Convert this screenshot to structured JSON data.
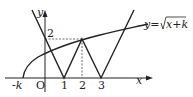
{
  "diagram": {
    "axes": {
      "x_label": "x",
      "y_label": "y",
      "origin_label": "O"
    },
    "x_ticks": [
      "-k",
      "1",
      "2",
      "3"
    ],
    "y_ticks": [
      "2"
    ],
    "curve_label": "y=√(x+k)",
    "curve_label_parts": {
      "lhs": "y=",
      "radicand": "x+k"
    },
    "curves": [
      {
        "name": "sqrt-curve",
        "formula": "y = sqrt(x + k)"
      },
      {
        "name": "zigzag-graph",
        "description": "W-shaped piecewise linear graph with zeros at x=1 and x=3, peak 2 at x=2"
      }
    ],
    "dashed_guides": [
      {
        "from": "(0,2)",
        "to": "(2,2)"
      },
      {
        "from": "(2,0)",
        "to": "(2,2)"
      }
    ],
    "colors": {
      "line": "#222222",
      "dash": "#444444"
    }
  }
}
